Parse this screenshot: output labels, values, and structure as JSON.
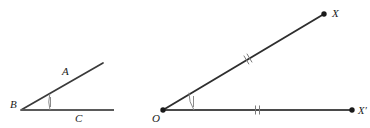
{
  "figure": {
    "background_color": "#ffffff",
    "stroke_color": "#3a3a3a",
    "mark_color": "#6e6e6e",
    "label_color": "#1a1a1a"
  },
  "left_figure": {
    "name": "angle-ABC",
    "vertex": {
      "label": "B",
      "x": 21,
      "y": 110,
      "label_x": 10,
      "label_y": 108
    },
    "rays": [
      {
        "name": "ray-BA",
        "label": "A",
        "from_x": 21,
        "from_y": 110,
        "to_x": 103,
        "to_y": 63,
        "label_x": 62,
        "label_y": 75
      },
      {
        "name": "ray-BC",
        "label": "C",
        "from_x": 21,
        "from_y": 110,
        "to_x": 114,
        "to_y": 110,
        "label_x": 75,
        "label_y": 122
      }
    ],
    "angle_arc": {
      "name": "angle-arc-B",
      "center_x": 21,
      "center_y": 110,
      "radius": 29,
      "tick_count": 1
    }
  },
  "right_figure": {
    "name": "angle-XOXprime",
    "vertex": {
      "label": "O",
      "x": 163,
      "y": 110,
      "label_x": 152,
      "label_y": 122,
      "dot": true
    },
    "rays": [
      {
        "name": "ray-OX",
        "label": "X",
        "from_x": 163,
        "from_y": 110,
        "to_x": 324,
        "to_y": 14,
        "label_x": 332,
        "label_y": 16,
        "endpoint_dot": true,
        "tick_count": 2,
        "tick_t": 0.52
      },
      {
        "name": "ray-OXprime",
        "label": "X′",
        "from_x": 163,
        "from_y": 110,
        "to_x": 352,
        "to_y": 110,
        "label_x": 358,
        "label_y": 114,
        "endpoint_dot": true,
        "tick_count": 2,
        "tick_t": 0.5
      }
    ],
    "angle_arc": {
      "name": "angle-arc-O",
      "center_x": 163,
      "center_y": 110,
      "radius": 31,
      "tick_count": 1
    }
  }
}
